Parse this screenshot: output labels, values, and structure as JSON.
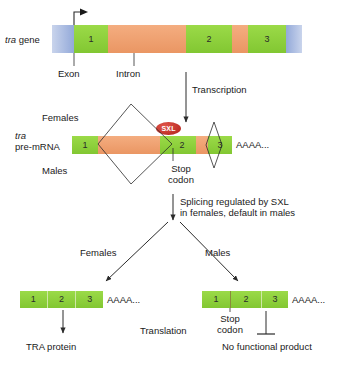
{
  "gene_row": {
    "label_italic": "tra",
    "label_rest": " gene",
    "segments": [
      {
        "kind": "utr",
        "text": ""
      },
      {
        "kind": "exon",
        "text": "1"
      },
      {
        "kind": "intron",
        "text": ""
      },
      {
        "kind": "exon",
        "text": "2"
      },
      {
        "kind": "intron",
        "text": ""
      },
      {
        "kind": "exon",
        "text": "3"
      },
      {
        "kind": "utr-r",
        "text": ""
      }
    ],
    "callouts": {
      "exon": "Exon",
      "intron": "Intron"
    },
    "promoter_icon": "transcription-start-arrow-icon"
  },
  "transcription": {
    "label": "Transcription",
    "arrow_icon": "down-arrow-icon"
  },
  "premrna_row": {
    "label_italic": "tra",
    "label_line2": "pre-mRNA",
    "females_label": "Females",
    "males_label": "Males",
    "segments": [
      {
        "kind": "exon",
        "text": "1"
      },
      {
        "kind": "intron",
        "text": ""
      },
      {
        "kind": "exon",
        "text": ""
      },
      {
        "kind": "exon",
        "text": "2"
      },
      {
        "kind": "intron",
        "text": ""
      },
      {
        "kind": "exon",
        "text": "3"
      }
    ],
    "polyA": "AAAA...",
    "sxl_label": "SXL",
    "stop_codon_label_line1": "Stop",
    "stop_codon_label_line2": "codon"
  },
  "splicing_note": {
    "line1": "Splicing regulated by SXL",
    "line2": "in females, default in males"
  },
  "branches": {
    "female_label": "Females",
    "male_label": "Males"
  },
  "female_mrna": {
    "segments": [
      {
        "kind": "exon",
        "text": "1"
      },
      {
        "kind": "exon",
        "text": "2"
      },
      {
        "kind": "exon",
        "text": "3"
      }
    ],
    "polyA": "AAAA...",
    "product": "TRA protein"
  },
  "male_mrna": {
    "segments": [
      {
        "kind": "exon",
        "text": "1"
      },
      {
        "kind": "exon",
        "text": "2"
      },
      {
        "kind": "exon",
        "text": "3"
      }
    ],
    "polyA": "AAAA...",
    "stop_codon_label_line1": "Stop",
    "stop_codon_label_line2": "codon",
    "product": "No functional product"
  },
  "translation": {
    "label": "Translation"
  },
  "colors": {
    "exon": "#8dd13c",
    "intron": "#f0a070",
    "utr": "#8fa8d8",
    "sxl": "#c8281e",
    "line": "#2b2b2b",
    "text": "#1a1a1a"
  }
}
